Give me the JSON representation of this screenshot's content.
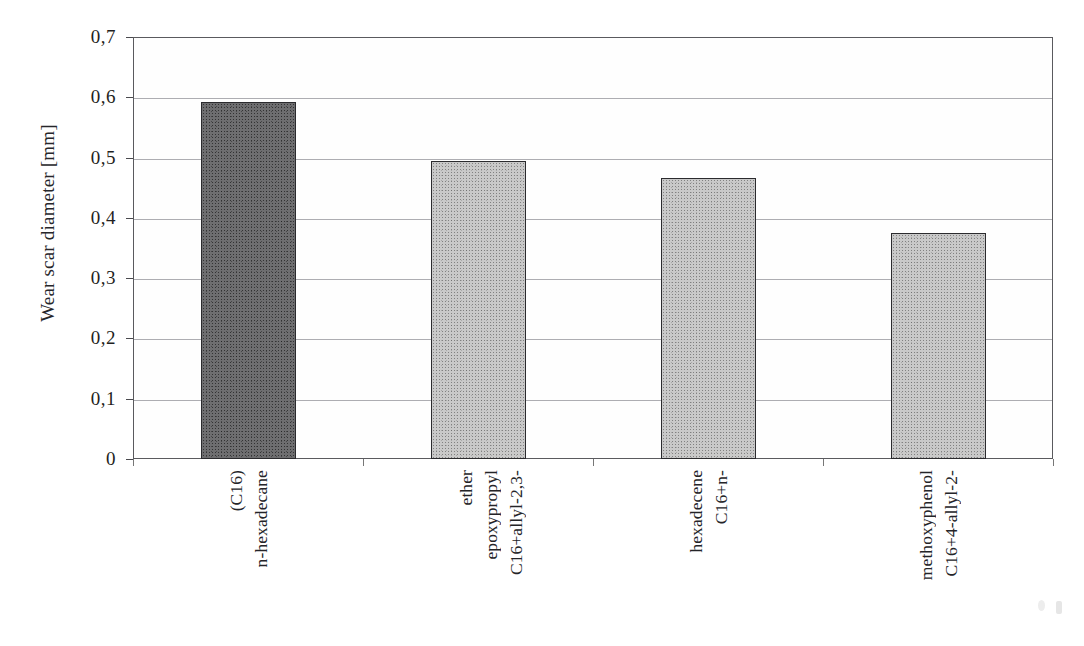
{
  "chart_data": {
    "type": "bar",
    "title": "",
    "xlabel": "",
    "ylabel": "Wear scar diameter [mm]",
    "categories": [
      "n-hexadecane (C16)",
      "C16+allyl-2,3-epoxypropyl ether",
      "C16+n-hexadecene",
      "C16+4-allyl-2-methoxyphenol"
    ],
    "category_lines": [
      [
        "n-hexadecane",
        "(C16)"
      ],
      [
        "C16+allyl-2,3-",
        "epoxypropyl",
        "ether"
      ],
      [
        "C16+n-",
        "hexadecene"
      ],
      [
        "C16+4-allyl-2-",
        "methoxyphenol"
      ]
    ],
    "values": [
      0.592,
      0.494,
      0.466,
      0.375
    ],
    "ylim": [
      0,
      0.7
    ],
    "ytick_values": [
      0,
      0.1,
      0.2,
      0.3,
      0.4,
      0.5,
      0.6,
      0.7
    ],
    "ytick_labels": [
      "0",
      "0,1",
      "0,2",
      "0,3",
      "0,4",
      "0,5",
      "0,6",
      "0,7"
    ],
    "grid": "horizontal",
    "legend": "none",
    "bar_styles": [
      "dark-gray",
      "light-gray",
      "light-gray",
      "light-gray"
    ],
    "colors": {
      "bar_dark": "#6e6e70",
      "bar_light": "#c9c9c9",
      "bar_outline": "#2b2b2e",
      "gridline": "#adadb2",
      "frame": "#5a5a5e",
      "text": "#242428",
      "background": "#ffffff"
    }
  },
  "axis": {
    "y_title": "Wear scar diameter [mm]"
  }
}
